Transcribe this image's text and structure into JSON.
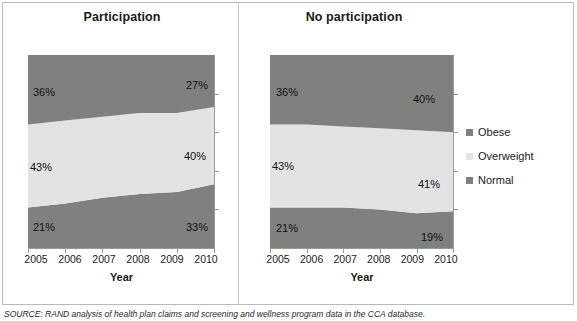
{
  "figure": {
    "source_note": "SOURCE: RAND analysis of health plan claims and screening and wellness program data in the CCA database."
  },
  "panels": {
    "left": {
      "title": "Participation",
      "axis_title": "Year"
    },
    "right": {
      "title": "No participation",
      "axis_title": "Year"
    }
  },
  "legend": {
    "items": [
      {
        "label": "Obese",
        "color": "#808080"
      },
      {
        "label": "Overweight",
        "color": "#E3E3E3"
      },
      {
        "label": "Normal",
        "color": "#808080"
      }
    ]
  },
  "colors": {
    "obese": "#808080",
    "overweight": "#E3E3E3",
    "normal": "#808080",
    "axis": "#9a9a9a",
    "text": "#1a1a1a"
  },
  "chart_data": [
    {
      "type": "area",
      "title": "Participation",
      "subtitle": "",
      "xlabel": "Year",
      "ylabel": "",
      "stacked": true,
      "stack_total": 100,
      "ylim": [
        0,
        100
      ],
      "grid": false,
      "legend_position": "right",
      "categories": [
        "2005",
        "2006",
        "2007",
        "2008",
        "2009",
        "2010"
      ],
      "x": [
        2005,
        2006,
        2007,
        2008,
        2009,
        2010
      ],
      "series": [
        {
          "name": "Normal",
          "values": [
            21,
            23,
            26,
            28,
            29,
            33
          ],
          "color": "#808080"
        },
        {
          "name": "Overweight",
          "values": [
            43,
            43,
            42,
            42,
            41,
            40
          ],
          "color": "#E3E3E3"
        },
        {
          "name": "Obese",
          "values": [
            36,
            34,
            32,
            30,
            30,
            27
          ],
          "color": "#808080"
        }
      ],
      "annotations": [
        {
          "text": "36%",
          "series": "Obese",
          "x": 2005
        },
        {
          "text": "27%",
          "series": "Obese",
          "x": 2010
        },
        {
          "text": "43%",
          "series": "Overweight",
          "x": 2005
        },
        {
          "text": "40%",
          "series": "Overweight",
          "x": 2010
        },
        {
          "text": "21%",
          "series": "Normal",
          "x": 2005
        },
        {
          "text": "33%",
          "series": "Normal",
          "x": 2010
        }
      ]
    },
    {
      "type": "area",
      "title": "No participation",
      "subtitle": "",
      "xlabel": "Year",
      "ylabel": "",
      "stacked": true,
      "stack_total": 100,
      "ylim": [
        0,
        100
      ],
      "grid": false,
      "legend_position": "right",
      "categories": [
        "2005",
        "2006",
        "2007",
        "2008",
        "2009",
        "2010"
      ],
      "x": [
        2005,
        2006,
        2007,
        2008,
        2009,
        2010
      ],
      "series": [
        {
          "name": "Normal",
          "values": [
            21,
            21,
            21,
            20,
            18,
            19
          ],
          "color": "#808080"
        },
        {
          "name": "Overweight",
          "values": [
            43,
            43,
            42,
            42,
            43,
            41
          ],
          "color": "#E3E3E3"
        },
        {
          "name": "Obese",
          "values": [
            36,
            36,
            37,
            38,
            39,
            40
          ],
          "color": "#808080"
        }
      ],
      "annotations": [
        {
          "text": "36%",
          "series": "Obese",
          "x": 2005
        },
        {
          "text": "40%",
          "series": "Obese",
          "x": 2010
        },
        {
          "text": "43%",
          "series": "Overweight",
          "x": 2005
        },
        {
          "text": "41%",
          "series": "Overweight",
          "x": 2010
        },
        {
          "text": "21%",
          "series": "Normal",
          "x": 2005
        },
        {
          "text": "19%",
          "series": "Normal",
          "x": 2010
        }
      ]
    }
  ],
  "data_labels": {
    "left": {
      "obese_start": "36%",
      "obese_end": "27%",
      "overweight_start": "43%",
      "overweight_end": "40%",
      "normal_start": "21%",
      "normal_end": "33%"
    },
    "right": {
      "obese_start": "36%",
      "obese_end": "40%",
      "overweight_start": "43%",
      "overweight_end": "41%",
      "normal_start": "21%",
      "normal_end": "19%"
    }
  },
  "xaxis": {
    "ticks": [
      "2005",
      "2006",
      "2007",
      "2008",
      "2009",
      "2010"
    ]
  }
}
